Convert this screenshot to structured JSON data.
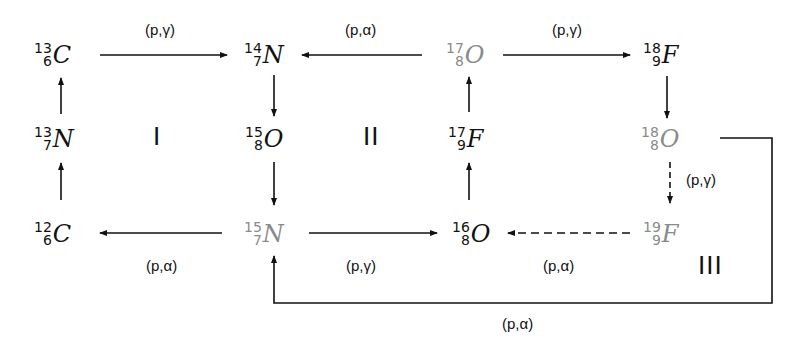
{
  "diagram": {
    "type": "CNO cycle reaction network",
    "colors": {
      "primary_nuclide": "#111111",
      "secondary_nuclide": "#8a8a8a",
      "arrow": "#111111"
    },
    "nuclides": [
      {
        "id": "c13",
        "mass": "13",
        "z": "6",
        "symbol": "C",
        "color": "black"
      },
      {
        "id": "n14",
        "mass": "14",
        "z": "7",
        "symbol": "N",
        "color": "black"
      },
      {
        "id": "o17",
        "mass": "17",
        "z": "8",
        "symbol": "O",
        "color": "gray"
      },
      {
        "id": "f18",
        "mass": "18",
        "z": "9",
        "symbol": "F",
        "color": "black"
      },
      {
        "id": "n13",
        "mass": "13",
        "z": "7",
        "symbol": "N",
        "color": "black"
      },
      {
        "id": "o15",
        "mass": "15",
        "z": "8",
        "symbol": "O",
        "color": "black"
      },
      {
        "id": "f17",
        "mass": "17",
        "z": "9",
        "symbol": "F",
        "color": "black"
      },
      {
        "id": "o18",
        "mass": "18",
        "z": "8",
        "symbol": "O",
        "color": "gray"
      },
      {
        "id": "c12",
        "mass": "12",
        "z": "6",
        "symbol": "C",
        "color": "black"
      },
      {
        "id": "n15",
        "mass": "15",
        "z": "7",
        "symbol": "N",
        "color": "gray"
      },
      {
        "id": "o16",
        "mass": "16",
        "z": "8",
        "symbol": "O",
        "color": "black"
      },
      {
        "id": "f19",
        "mass": "19",
        "z": "9",
        "symbol": "F",
        "color": "gray"
      }
    ],
    "reaction_labels": {
      "c13_to_n14": "(p,γ)",
      "o17_to_n14": "(p,α)",
      "o17_to_f18": "(p,γ)",
      "o18_to_f19": "(p,γ)",
      "n15_to_c12": "(p,α)",
      "n15_to_o16": "(p,γ)",
      "f19_to_o16": "(p,α)",
      "o18_to_n15": "(p,α)"
    },
    "cycle_labels": {
      "cycle1": "I",
      "cycle2": "II",
      "cycle3": "III"
    }
  }
}
